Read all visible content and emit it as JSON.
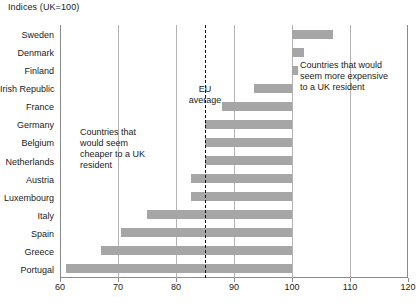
{
  "chart_data": {
    "type": "bar",
    "orientation": "horizontal",
    "title": "Indices (UK=100)",
    "xlabel": "",
    "ylabel": "",
    "xlim": [
      60,
      120
    ],
    "xticks": [
      60,
      70,
      80,
      90,
      100,
      110,
      120
    ],
    "xtick_labels": [
      "60",
      "70",
      "80",
      "90",
      "100",
      "110",
      "120"
    ],
    "grid": true,
    "grid_axis": "x",
    "baseline": 100,
    "reference_line": {
      "label": "EU average",
      "value": 85,
      "style": "dashed"
    },
    "categories": [
      "Sweden",
      "Denmark",
      "Finland",
      "Irish Republic",
      "France",
      "Germany",
      "Belgium",
      "Netherlands",
      "Austria",
      "Luxembourg",
      "Italy",
      "Spain",
      "Greece",
      "Portugal"
    ],
    "values": [
      107,
      102,
      101,
      93.5,
      88,
      85,
      85,
      85,
      82.5,
      82.5,
      75,
      70.5,
      67,
      61
    ],
    "bar_color": "#a6a6a6",
    "annotations": [
      {
        "name": "cheaper-annotation",
        "lines": [
          "Countries that",
          "would seem",
          "cheaper to a UK",
          "resident"
        ]
      },
      {
        "name": "expensive-annotation",
        "lines": [
          "Countries that would",
          "seem more expensive",
          "to a UK resident"
        ]
      },
      {
        "name": "eu-average-annotation",
        "lines": [
          "EU",
          "average"
        ]
      }
    ]
  },
  "colors": {
    "bar": "#a6a6a6",
    "grid": "#b3b3b3",
    "axis": "#8a8a8a",
    "text": "#1a1a1a",
    "eu_line": "#111111"
  },
  "footnote": {
    "text": ""
  }
}
